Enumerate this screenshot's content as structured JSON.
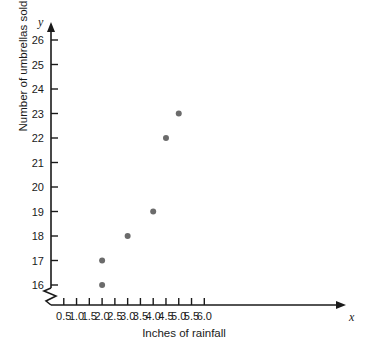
{
  "chart_data": {
    "type": "scatter",
    "title": "",
    "xlabel": "Inches of rainfall",
    "ylabel": "Number of umbrellas sold",
    "x_axis_symbol": "x",
    "y_axis_symbol": "y",
    "xlim": [
      0,
      6.4
    ],
    "ylim": [
      15.4,
      26.6
    ],
    "grid": false,
    "legend": null,
    "y_axis_broken": true,
    "xticks": [
      "0.5",
      "1.0",
      "1.5",
      "2.0",
      "2.5",
      "3.0",
      "3.5",
      "4.0",
      "4.5",
      "5.0",
      "5.5",
      "6.0"
    ],
    "xtick_values": [
      0.5,
      1.0,
      1.5,
      2.0,
      2.5,
      3.0,
      3.5,
      4.0,
      4.5,
      5.0,
      5.5,
      6.0
    ],
    "yticks": [
      "16",
      "17",
      "18",
      "19",
      "20",
      "21",
      "22",
      "23",
      "24",
      "25",
      "26"
    ],
    "ytick_values": [
      16,
      17,
      18,
      19,
      20,
      21,
      22,
      23,
      24,
      25,
      26
    ],
    "points": [
      {
        "x": 2.0,
        "y": 16
      },
      {
        "x": 2.0,
        "y": 17
      },
      {
        "x": 3.0,
        "y": 18
      },
      {
        "x": 4.0,
        "y": 19
      },
      {
        "x": 4.5,
        "y": 22
      },
      {
        "x": 5.0,
        "y": 23
      }
    ],
    "marker_color": "#6b6b6b",
    "marker_size": 6,
    "axis_color": "#1a1a1a",
    "background_color": "#ffffff"
  }
}
